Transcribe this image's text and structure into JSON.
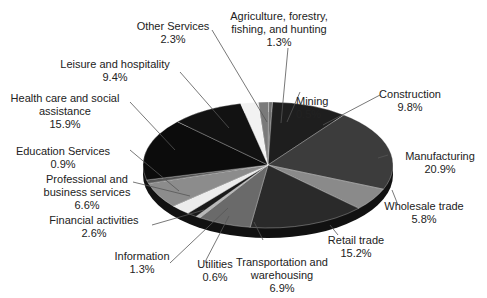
{
  "chart_data": {
    "type": "pie",
    "style": "3d-tilted",
    "title": "",
    "unit": "%",
    "slices": [
      {
        "label": [
          "Mining"
        ],
        "value": 0.5,
        "color": "#6e6e6e"
      },
      {
        "label": [
          "Construction"
        ],
        "value": 9.8,
        "color": "#1e1e1e"
      },
      {
        "label": [
          "Manufacturing"
        ],
        "value": 20.9,
        "color": "#3c3c3c"
      },
      {
        "label": [
          "Wholesale trade"
        ],
        "value": 5.8,
        "color": "#8a8a8a"
      },
      {
        "label": [
          "Retail trade"
        ],
        "value": 15.2,
        "color": "#2a2a2a"
      },
      {
        "label": [
          "Transportation and",
          "warehousing"
        ],
        "value": 6.9,
        "color": "#6a6a6a"
      },
      {
        "label": [
          "Utilities"
        ],
        "value": 0.6,
        "color": "#b8b8b8"
      },
      {
        "label": [
          "Information"
        ],
        "value": 1.3,
        "color": "#1a1a1a"
      },
      {
        "label": [
          "Financial activities"
        ],
        "value": 2.6,
        "color": "#ececec"
      },
      {
        "label": [
          "Professional and",
          "business services"
        ],
        "value": 6.6,
        "color": "#8c8c8c"
      },
      {
        "label": [
          "Education Services"
        ],
        "value": 0.9,
        "color": "#555555"
      },
      {
        "label": [
          "Health care and social",
          "assistance"
        ],
        "value": 15.9,
        "color": "#0c0c0c"
      },
      {
        "label": [
          "Leisure and hospitality"
        ],
        "value": 9.4,
        "color": "#121212"
      },
      {
        "label": [
          "Other Services"
        ],
        "value": 2.3,
        "color": "#f2f2f2"
      },
      {
        "label": [
          "Agriculture, forestry,",
          "fishing, and hunting"
        ],
        "value": 1.3,
        "color": "#7a7a7a"
      }
    ],
    "labels_text": {
      "mining": [
        "Mining",
        "0.5%"
      ],
      "construction": [
        "Construction",
        "9.8%"
      ],
      "manufacturing": [
        "Manufacturing",
        "20.9%"
      ],
      "wholesale": [
        "Wholesale trade",
        "5.8%"
      ],
      "retail": [
        "Retail trade",
        "15.2%"
      ],
      "transport": [
        "Transportation and",
        "warehousing",
        "6.9%"
      ],
      "utilities": [
        "Utilities",
        "0.6%"
      ],
      "information": [
        "Information",
        "1.3%"
      ],
      "financial": [
        "Financial activities",
        "2.6%"
      ],
      "professional": [
        "Professional and",
        "business services",
        "6.6%"
      ],
      "education": [
        "Education Services",
        "0.9%"
      ],
      "health": [
        "Health care and social",
        "assistance",
        "15.9%"
      ],
      "leisure": [
        "Leisure and hospitality",
        "9.4%"
      ],
      "other": [
        "Other Services",
        "2.3%"
      ],
      "agriculture": [
        "Agriculture, forestry,",
        "fishing, and hunting",
        "1.3%"
      ]
    }
  }
}
